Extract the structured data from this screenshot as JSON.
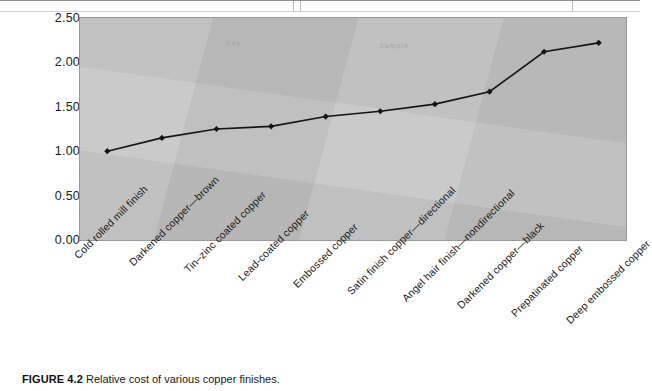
{
  "page": {
    "table_fragment_present": true
  },
  "chart_data": {
    "type": "line",
    "title": "",
    "xlabel": "",
    "ylabel": "",
    "ylim": [
      0.0,
      2.5
    ],
    "ytick_step": 0.5,
    "ytick_labels": [
      "0.00",
      "0.50",
      "1.00",
      "1.50",
      "2.00",
      "2.50"
    ],
    "ytick_values": [
      0.0,
      0.5,
      1.0,
      1.5,
      2.0,
      2.5
    ],
    "grid": false,
    "legend": "none",
    "plot_background_color": "#c4c4c4",
    "line_color": "#151515",
    "marker": "diamond",
    "categories": [
      "Cold rolled mill finish",
      "Darkened copper—brown",
      "Tin–zinc coated copper",
      "Lead-coated copper",
      "Embossed copper",
      "Satin finish copper—directional",
      "Angel hair finish—nondirectional",
      "Darkened copper—black",
      "Prepatinated copper",
      "Deep embossed copper"
    ],
    "values": [
      1.0,
      1.15,
      1.25,
      1.28,
      1.39,
      1.45,
      1.53,
      1.67,
      2.12,
      2.22
    ]
  },
  "caption": {
    "figure_number": "FIGURE 4.2",
    "text": "Relative cost of various copper finishes."
  }
}
